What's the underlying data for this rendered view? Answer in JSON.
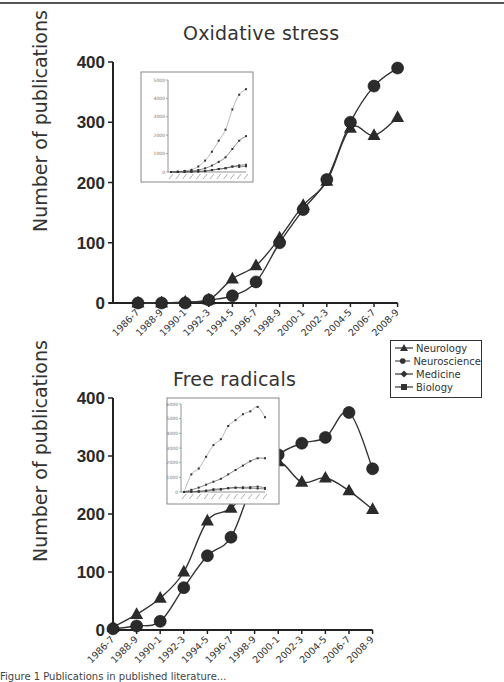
{
  "figure": {
    "caption_fragment": "Figure 1 Publications in published literature..."
  },
  "legend": {
    "items": [
      {
        "label": "Neurology",
        "marker": "triangle"
      },
      {
        "label": "Neuroscience",
        "marker": "circle"
      },
      {
        "label": "Medicine",
        "marker": "diamond"
      },
      {
        "label": "Biology",
        "marker": "square"
      }
    ]
  },
  "chart_data": [
    {
      "type": "line",
      "title": "Oxidative stress",
      "xlabel": "",
      "ylabel": "Number of publications",
      "ylim": [
        0,
        400
      ],
      "yticks": [
        0,
        100,
        200,
        300,
        400
      ],
      "grid": false,
      "categories": [
        "1986-7",
        "1988-9",
        "1990-1",
        "1992-3",
        "1994-5",
        "1996-7",
        "1998-9",
        "2000-1",
        "2002-3",
        "2004-5",
        "2006-7",
        "2008-9"
      ],
      "series": [
        {
          "name": "Neurology",
          "marker": "triangle",
          "values": [
            0,
            0,
            2,
            5,
            40,
            62,
            108,
            162,
            202,
            290,
            278,
            308
          ]
        },
        {
          "name": "Neuroscience",
          "marker": "circle",
          "values": [
            0,
            0,
            0,
            5,
            12,
            35,
            100,
            155,
            205,
            300,
            360,
            390
          ]
        }
      ],
      "inset": {
        "type": "line",
        "ylim": [
          0,
          5000
        ],
        "yticks": [
          0,
          1000,
          2000,
          3000,
          4000,
          5000
        ],
        "series": [
          {
            "name": "Medicine",
            "values": [
              0,
              20,
              60,
              120,
              300,
              620,
              1100,
              1700,
              2300,
              3400,
              4200,
              4500
            ]
          },
          {
            "name": "Biology",
            "values": [
              0,
              10,
              30,
              60,
              110,
              200,
              350,
              550,
              800,
              1250,
              1700,
              1950
            ]
          },
          {
            "name": "Neuroscience",
            "values": [
              0,
              0,
              5,
              10,
              20,
              40,
              100,
              160,
              210,
              300,
              360,
              390
            ]
          },
          {
            "name": "Neurology",
            "values": [
              0,
              0,
              5,
              10,
              40,
              60,
              110,
              160,
              200,
              290,
              280,
              310
            ]
          }
        ]
      }
    },
    {
      "type": "line",
      "title": "Free radicals",
      "xlabel": "",
      "ylabel": "Number of publications",
      "ylim": [
        0,
        400
      ],
      "yticks": [
        0,
        100,
        200,
        300,
        400
      ],
      "grid": false,
      "categories": [
        "1986-7",
        "1988-9",
        "1990-1",
        "1992-3",
        "1994-5",
        "1996-7",
        "1998-9",
        "2000-1",
        "2002-3",
        "2004-5",
        "2006-7",
        "2008-9"
      ],
      "series": [
        {
          "name": "Neurology",
          "marker": "triangle",
          "values": [
            5,
            27,
            55,
            100,
            188,
            210,
            258,
            290,
            255,
            262,
            240,
            208
          ]
        },
        {
          "name": "Neuroscience",
          "marker": "circle",
          "values": [
            2,
            7,
            15,
            73,
            128,
            160,
            258,
            302,
            322,
            332,
            375,
            278
          ]
        }
      ],
      "inset": {
        "type": "line",
        "ylim": [
          0,
          6000
        ],
        "yticks": [
          0,
          1000,
          2000,
          3000,
          4000,
          5000,
          6000
        ],
        "series": [
          {
            "name": "Medicine",
            "values": [
              0,
              1200,
              1600,
              2400,
              3200,
              3600,
              4500,
              4900,
              5300,
              5500,
              5800,
              5100
            ]
          },
          {
            "name": "Biology",
            "values": [
              0,
              150,
              300,
              500,
              700,
              900,
              1200,
              1500,
              1800,
              2100,
              2300,
              2300
            ]
          },
          {
            "name": "Neuroscience",
            "values": [
              0,
              10,
              20,
              70,
              130,
              160,
              260,
              300,
              320,
              330,
              370,
              280
            ]
          },
          {
            "name": "Neurology",
            "values": [
              0,
              30,
              60,
              100,
              190,
              210,
              260,
              290,
              260,
              260,
              240,
              210
            ]
          }
        ]
      }
    }
  ]
}
